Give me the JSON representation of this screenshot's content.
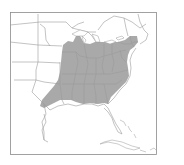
{
  "map": {
    "type": "range-map",
    "region": "Eastern United States",
    "colors": {
      "background": "#ffffff",
      "land": "#ffffff",
      "range_fill": "#a9a9a9",
      "border": "#9a9a9a",
      "frame": "#8a8a8a"
    },
    "legend": null
  }
}
